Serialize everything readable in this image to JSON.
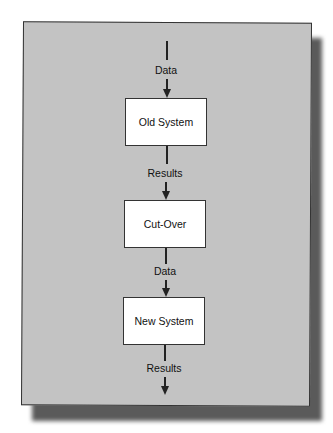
{
  "diagram": {
    "type": "flowchart",
    "direction": "top-to-bottom",
    "nodes": [
      {
        "id": "old",
        "label": "Old System"
      },
      {
        "id": "cut",
        "label": "Cut-Over"
      },
      {
        "id": "new",
        "label": "New System"
      }
    ],
    "edges": [
      {
        "from": "input",
        "to": "old",
        "label": "Data"
      },
      {
        "from": "old",
        "to": "cut",
        "label": "Results"
      },
      {
        "from": "cut",
        "to": "new",
        "label": "Data"
      },
      {
        "from": "new",
        "to": "output",
        "label": "Results"
      }
    ],
    "colors": {
      "background": "#c3c3c3",
      "box": "#ffffff",
      "line": "#222222"
    }
  }
}
